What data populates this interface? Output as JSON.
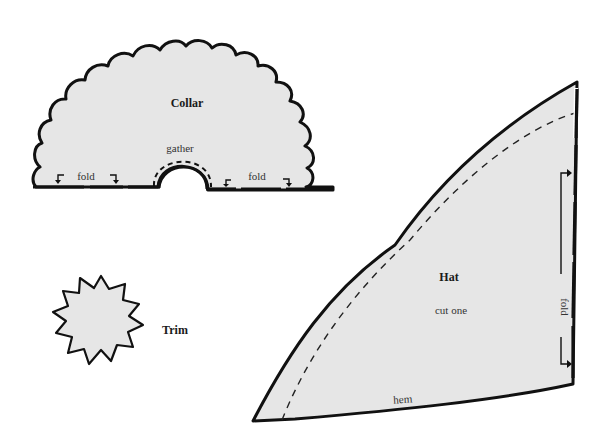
{
  "diagram": {
    "type": "sewing-pattern",
    "colors": {
      "fabric_fill": "#e6e6e6",
      "outline": "#111111",
      "background": "#ffffff"
    },
    "pieces": {
      "collar": {
        "title": "Collar",
        "gather_label": "gather",
        "fold_left_label": "fold",
        "fold_right_label": "fold"
      },
      "trim": {
        "title": "Trim"
      },
      "hat": {
        "title": "Hat",
        "instruction": "cut one",
        "hem_label": "hem",
        "fold_label": "fold"
      }
    }
  }
}
